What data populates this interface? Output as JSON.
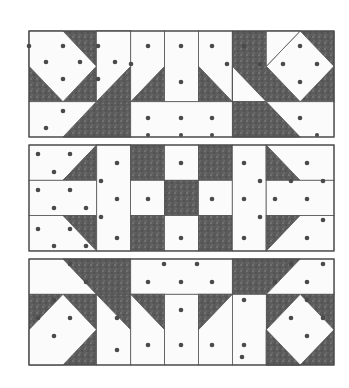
{
  "figure": {
    "colors": {
      "light": "#fbfbfb",
      "dark": "#5a5a5a",
      "dot": "#4a4a4a",
      "outline": "#4a4a4a"
    },
    "panels": [
      {
        "id": "top",
        "x": 29,
        "y": 31,
        "width": 305,
        "height": 106
      },
      {
        "id": "middle",
        "x": 29,
        "y": 145,
        "width": 305,
        "height": 106
      },
      {
        "id": "bottom",
        "x": 29,
        "y": 259,
        "width": 305,
        "height": 106
      }
    ]
  }
}
